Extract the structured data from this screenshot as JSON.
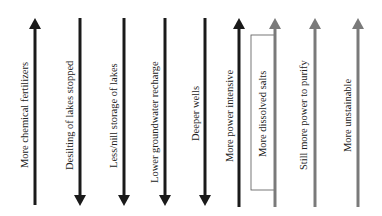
{
  "diagram": {
    "type": "cascade-of-consequences",
    "colors": {
      "dark": "#1a1a1a",
      "gray": "#7a7a7a",
      "box_border": "#555555"
    },
    "arrows": [
      {
        "id": 1,
        "label": "More chemical fertilizers",
        "direction": "up",
        "color": "dark"
      },
      {
        "id": 2,
        "label": "Desilting of lakes stopped",
        "direction": "down",
        "color": "dark"
      },
      {
        "id": 3,
        "label": "Less/nill storage of lakes",
        "direction": "down",
        "color": "dark"
      },
      {
        "id": 4,
        "label": "Lower groundwater recharge",
        "direction": "down",
        "color": "dark"
      },
      {
        "id": 5,
        "label": "Deeper wells",
        "direction": "down",
        "color": "dark"
      },
      {
        "id": 6,
        "label": "More power intensive",
        "direction": "up",
        "color": "dark"
      },
      {
        "id": 7,
        "label": "More dissolved salts",
        "direction": "up",
        "color": "gray",
        "boxed": true
      },
      {
        "id": 8,
        "label": "Still more power to purify",
        "direction": "up",
        "color": "gray"
      },
      {
        "id": 9,
        "label": "More unstainable",
        "direction": "up",
        "color": "gray"
      }
    ]
  }
}
